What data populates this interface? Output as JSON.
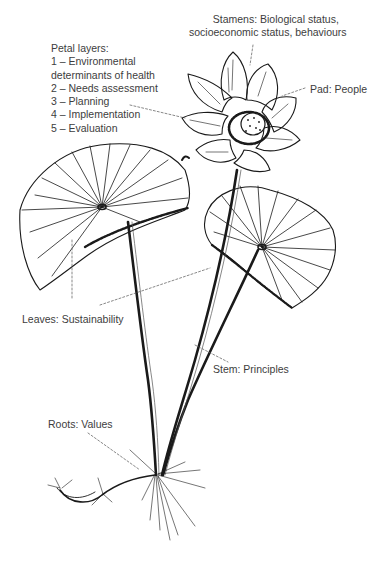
{
  "diagram": {
    "labels": {
      "petal_layers": {
        "title": "Petal layers:",
        "items": [
          "1 – Environmental",
          "determinants of health",
          "2 – Needs assessment",
          "3 – Planning",
          "4 – Implementation",
          "5 – Evaluation"
        ]
      },
      "stamens": {
        "line1": "Stamens: Biological status,",
        "line2": "socioeconomic status, behaviours"
      },
      "pad": "Pad: People",
      "leaves": "Leaves: Sustainability",
      "stem": "Stem: Principles",
      "roots": "Roots: Values"
    },
    "colors": {
      "ink": "#1a1a1a",
      "label_text": "#3d3d3d",
      "background": "#ffffff"
    }
  }
}
